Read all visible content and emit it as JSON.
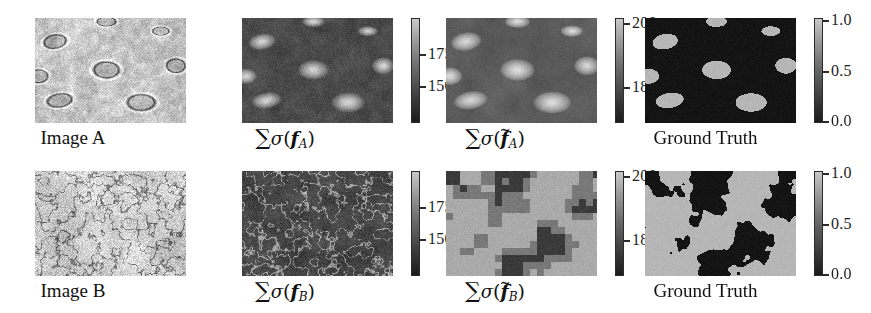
{
  "figure": {
    "rows": [
      {
        "id": "row-a",
        "cells": [
          {
            "name": "image-a",
            "caption_text": "Image A",
            "caption_type": "plain",
            "has_colorbar": false,
            "map_kind": "micrograph-a"
          },
          {
            "name": "sigma-f-a",
            "caption_type": "math",
            "caption_parts": {
              "sum": "∑",
              "sigma": "σ",
              "open": "(",
              "var": "f",
              "tilde": "",
              "sub": "A",
              "close": ")"
            },
            "caption_text": "∑σ(f A)",
            "has_colorbar": true,
            "colorbar": {
              "ticks": [
                {
                  "label": "175",
                  "pos_pct": 34
                },
                {
                  "label": "150",
                  "pos_pct": 65
                }
              ]
            },
            "map_kind": "uncertainty-a-coarse"
          },
          {
            "name": "sigma-f-tilde-a",
            "caption_type": "math",
            "caption_parts": {
              "sum": "∑",
              "sigma": "σ",
              "open": "(",
              "var": "f",
              "tilde": "̃",
              "sub": "A",
              "close": ")"
            },
            "caption_text": "∑σ(f̃ A)",
            "has_colorbar": true,
            "colorbar": {
              "ticks": [
                {
                  "label": "200",
                  "pos_pct": 5
                },
                {
                  "label": "180",
                  "pos_pct": 66
                }
              ]
            },
            "map_kind": "uncertainty-a-smooth"
          },
          {
            "name": "ground-truth-a",
            "caption_text": "Ground Truth",
            "caption_type": "plain",
            "has_colorbar": true,
            "colorbar": {
              "ticks": [
                {
                  "label": "1.0",
                  "pos_pct": 2
                },
                {
                  "label": "0.5",
                  "pos_pct": 50
                },
                {
                  "label": "0.0",
                  "pos_pct": 98
                }
              ]
            },
            "map_kind": "groundtruth-a"
          }
        ]
      },
      {
        "id": "row-b",
        "cells": [
          {
            "name": "image-b",
            "caption_text": "Image B",
            "caption_type": "plain",
            "has_colorbar": false,
            "map_kind": "micrograph-b"
          },
          {
            "name": "sigma-f-b",
            "caption_type": "math",
            "caption_parts": {
              "sum": "∑",
              "sigma": "σ",
              "open": "(",
              "var": "f",
              "tilde": "",
              "sub": "B",
              "close": ")"
            },
            "caption_text": "∑σ(f B)",
            "has_colorbar": true,
            "colorbar": {
              "ticks": [
                {
                  "label": "175",
                  "pos_pct": 34
                },
                {
                  "label": "150",
                  "pos_pct": 65
                }
              ]
            },
            "map_kind": "uncertainty-b-coarse"
          },
          {
            "name": "sigma-f-tilde-b",
            "caption_type": "math",
            "caption_parts": {
              "sum": "∑",
              "sigma": "σ",
              "open": "(",
              "var": "f",
              "tilde": "̃",
              "sub": "B",
              "close": ")"
            },
            "caption_text": "∑σ(f̃ B)",
            "has_colorbar": true,
            "colorbar": {
              "ticks": [
                {
                  "label": "200",
                  "pos_pct": 5
                },
                {
                  "label": "180",
                  "pos_pct": 66
                }
              ]
            },
            "map_kind": "uncertainty-b-blocky"
          },
          {
            "name": "ground-truth-b",
            "caption_text": "Ground Truth",
            "caption_type": "plain",
            "has_colorbar": true,
            "colorbar": {
              "ticks": [
                {
                  "label": "1.0",
                  "pos_pct": 2
                },
                {
                  "label": "0.5",
                  "pos_pct": 50
                },
                {
                  "label": "0.0",
                  "pos_pct": 98
                }
              ]
            },
            "map_kind": "groundtruth-b"
          }
        ]
      }
    ],
    "colors": {
      "background": "#ffffff",
      "text": "#1a1a1a",
      "colorbar_low": "#1b1b1b",
      "colorbar_high": "#c9c9c9",
      "mask_foreground": "#b4b4b4",
      "mask_background": "#141414"
    }
  }
}
